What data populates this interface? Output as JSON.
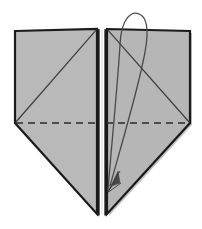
{
  "figure": {
    "canvas": {
      "width": 202,
      "height": 229
    },
    "background_color": "#ffffff"
  },
  "style": {
    "paper_fill": "#b9b9b9",
    "paper_fill_right": "#b6b6b6",
    "outline_color": "#1a1a1a",
    "outline_width": 2.2,
    "crease_color": "#3d3d3d",
    "crease_width": 1.2,
    "dashed_color": "#2a2a2a",
    "dashed_width": 1.3,
    "dash_pattern": "7,5",
    "arrow_color": "#4a4a4a",
    "arrow_width": 1.3,
    "spine_gap_color": "#ffffff",
    "shadow_color": "#8f8f8f"
  },
  "shapes": {
    "left_panel": {
      "name": "left-paper-panel",
      "points": "15,31 97,29 97,214 15,123",
      "fill": "#b9b9b9"
    },
    "right_panel": {
      "name": "right-paper-panel",
      "points": "107,29 190,31 190,123 107,214",
      "fill": "#b6b6b6"
    },
    "left_diagonal_crease": {
      "name": "left-diagonal-crease",
      "from": "15,123",
      "to": "97,29"
    },
    "right_diagonal_crease": {
      "name": "right-diagonal-crease",
      "from": "107,29",
      "to": "190,123"
    },
    "dashed_valley_crease": {
      "name": "dashed-valley-crease",
      "from": "15,123",
      "to": "190,123"
    },
    "spine": {
      "name": "center-spine",
      "left_edge_x": 98.5,
      "right_edge_x": 105.5,
      "top_y": 29,
      "bottom_y": 216,
      "gap_fill": "#ffffff"
    },
    "arrow_curve": {
      "name": "fold-direction-arrow",
      "path": "M 108,190 C 112,140 118,80 120,45 C 121,18 132,9 141,15 C 150,21 148,40 143,62 C 136,96 120,150 110,186",
      "head_points": "108,192 118,171 120,183 112,186",
      "head_tip": "108,192"
    }
  },
  "annotations": {
    "step_label": "",
    "caption": ""
  }
}
